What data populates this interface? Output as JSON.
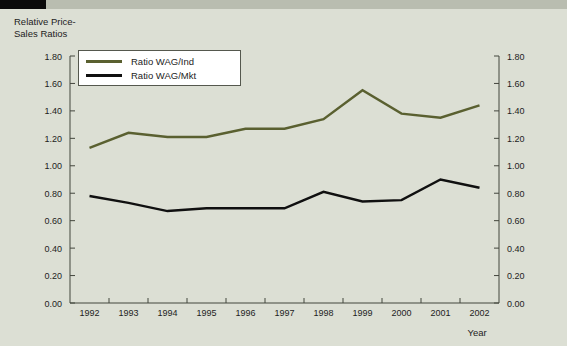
{
  "figure": {
    "background_color": "#dcdfd4",
    "top_strip_color": "#b9bdb0",
    "top_bar_color": "#0a0a0a",
    "axis_title": "Relative Price-\nSales Ratios"
  },
  "legend": {
    "position": "top-left-inside",
    "entries": [
      {
        "label": "Ratio WAG/Ind",
        "color": "#5a6030"
      },
      {
        "label": "Ratio WAG/Mkt",
        "color": "#101010"
      }
    ]
  },
  "chart_data": {
    "type": "line",
    "title": "",
    "subtitle": "",
    "xlabel": "Year",
    "ylabel": "Relative Price-Sales Ratios",
    "categories": [
      "1992",
      "1993",
      "1994",
      "1995",
      "1996",
      "1997",
      "1998",
      "1999",
      "2000",
      "2001",
      "2002"
    ],
    "ylim": [
      0.0,
      1.8
    ],
    "ytick_labels": [
      "0.00",
      "0.20",
      "0.40",
      "0.60",
      "0.80",
      "1.00",
      "1.20",
      "1.40",
      "1.60",
      "1.80"
    ],
    "ytick_values": [
      0.0,
      0.2,
      0.4,
      0.6,
      0.8,
      1.0,
      1.2,
      1.4,
      1.6,
      1.8
    ],
    "right_axis_mirrored": true,
    "right_ytick_labels": [
      "0.00",
      "0.20",
      "0.40",
      "0.60",
      "0.80",
      "1.00",
      "1.20",
      "1.40",
      "1.60",
      "1.80"
    ],
    "grid": false,
    "legend_position": "upper left",
    "series": [
      {
        "name": "Ratio WAG/Ind",
        "color": "#5a6030",
        "values": [
          1.13,
          1.24,
          1.21,
          1.21,
          1.27,
          1.27,
          1.34,
          1.55,
          1.38,
          1.35,
          1.44
        ]
      },
      {
        "name": "Ratio WAG/Mkt",
        "color": "#101010",
        "values": [
          0.78,
          0.73,
          0.67,
          0.69,
          0.69,
          0.69,
          0.81,
          0.74,
          0.75,
          0.9,
          0.84
        ]
      }
    ]
  }
}
